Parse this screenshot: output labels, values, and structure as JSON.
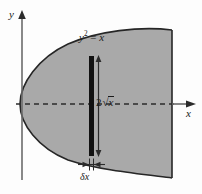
{
  "figure": {
    "kind": "math-diagram",
    "background_color": "#fdfdfd",
    "axes": {
      "y_axis_label": "y",
      "x_axis_label": "x",
      "axis_color": "#6b6b6b",
      "x_axis_style": "dashed",
      "y_axis_style": "solid",
      "origin_x": 22,
      "origin_y": 104
    },
    "curve": {
      "equation_label_parts": {
        "base": "y",
        "exponent": "2",
        "relation": " = ",
        "variable": "x"
      },
      "equation_text": "y2 = x",
      "curve_color": "#262626",
      "fill_color": "#a9a9a9",
      "vertex_x": 20,
      "right_boundary_x": 172,
      "top_at_right_y": 30,
      "bottom_at_right_y": 178
    },
    "strip": {
      "label_parts": {
        "coefficient": "2",
        "radical": "√",
        "radicand": "x"
      },
      "height_label_text": "2√x",
      "width_label_text": "δx",
      "strip_color": "#111111",
      "strip_x": 89,
      "strip_width": 5,
      "strip_top_y": 56,
      "strip_bottom_y": 156
    }
  }
}
